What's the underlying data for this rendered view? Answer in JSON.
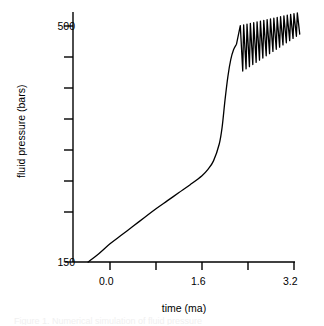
{
  "chart_data": {
    "type": "line",
    "title": "",
    "subtitle": "",
    "xlabel": "time (ma)",
    "ylabel": "fluid pressure (bars)",
    "xlim": [
      -0.5,
      3.55
    ],
    "ylim": [
      150,
      530
    ],
    "grid": false,
    "legend": null,
    "legend_position": "none",
    "x_ticks": [
      {
        "value": 0.0,
        "label": "0.0",
        "px": 110
      },
      {
        "value": 0.8,
        "label": "",
        "px": 156
      },
      {
        "value": 1.6,
        "label": "1.6",
        "px": 202
      },
      {
        "value": 2.4,
        "label": "",
        "px": 248
      },
      {
        "value": 3.2,
        "label": "3.2",
        "px": 294
      }
    ],
    "y_ticks": [
      {
        "value": 500,
        "label": "500",
        "px": 26
      },
      {
        "value": 450,
        "label": "",
        "px": 57
      },
      {
        "value": 400,
        "label": "",
        "px": 88
      },
      {
        "value": 350,
        "label": "",
        "px": 119
      },
      {
        "value": 300,
        "label": "",
        "px": 150
      },
      {
        "value": 250,
        "label": "",
        "px": 181
      },
      {
        "value": 200,
        "label": "",
        "px": 212
      },
      {
        "value": 150,
        "label": "150",
        "px": 262
      }
    ],
    "y_tick_labels_shown": [
      "500",
      "150"
    ],
    "x_tick_labels_shown": [
      "0.0",
      "1.6",
      "3.2"
    ],
    "series": [
      {
        "name": "fluid pressure",
        "color": "#000000",
        "line_width": 1.3,
        "description": "Slow near-linear pressure buildup from 150 bars at the origin, a gentle knee near t=1.75 ma, then a steep rise to about 470 bars at t=2.2 ma, followed by a sawtooth cycling between roughly 430 and 515 bars with amplitude decreasing and mean drifting upward to t=3.2 ma.",
        "x": [
          -0.38,
          -0.2,
          0.0,
          0.2,
          0.4,
          0.6,
          0.8,
          1.0,
          1.2,
          1.4,
          1.6,
          1.7,
          1.8,
          1.9,
          1.95,
          2.0,
          2.05,
          2.1,
          2.15,
          2.2
        ],
        "y": [
          150,
          162,
          177,
          190,
          203,
          216,
          229,
          241,
          253,
          265,
          278,
          287,
          300,
          325,
          350,
          390,
          425,
          450,
          465,
          473
        ],
        "oscillation": {
          "start_x": 2.25,
          "end_x": 3.3,
          "cycles": 18,
          "peak_start": 500,
          "peak_end": 520,
          "trough_start": 430,
          "trough_end": 488
        }
      }
    ]
  },
  "axes": {
    "y_axis_name": "fluid-pressure-axis",
    "x_axis_name": "time-axis"
  },
  "caption": {
    "partial_text": "Figure 1. Numerical simulation of fluid pressure"
  }
}
